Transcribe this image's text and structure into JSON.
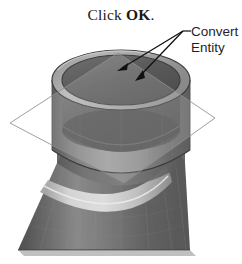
{
  "figure": {
    "kind": "cad-shaded-model-figure",
    "background_color": "#ffffff"
  },
  "instruction": {
    "prefix": "Click ",
    "emphasis": "OK",
    "suffix": "."
  },
  "callout": {
    "line1": "Convert",
    "line2": "Entity",
    "leader_color": "#111111",
    "arrow_count": 2
  },
  "model": {
    "name": "cylindrical-boss-on-flared-base",
    "shading": "grayscale",
    "parts": [
      {
        "name": "flared-conical-base",
        "tone": "#6f6f6f"
      },
      {
        "name": "cylindrical-boss",
        "tone": "#7a7a7a"
      },
      {
        "name": "boss-top-annular-face",
        "tone": "#9a9a9a"
      },
      {
        "name": "inner-bore",
        "tone": "#5b5b5b"
      },
      {
        "name": "fillet-highlight",
        "tone": "#cfcfcf"
      }
    ],
    "sketch_plane": {
      "name": "sketch-plane-parallelogram",
      "outline_color": "#8d8d8d",
      "fill_color": "rgba(255,255,255,0.18)"
    }
  }
}
